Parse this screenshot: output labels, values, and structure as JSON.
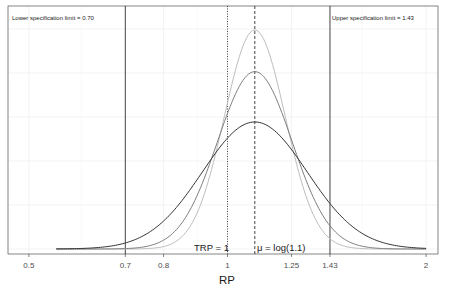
{
  "chart_data": {
    "type": "line",
    "title": "",
    "xlabel": "RP",
    "ylabel": "",
    "x_scale": "log",
    "xlim": [
      0.5,
      2
    ],
    "x_ticks": [
      0.5,
      0.7,
      0.8,
      1,
      1.25,
      1.43,
      2
    ],
    "x_tick_labels": [
      "0.5",
      "0.7",
      "0.8",
      "1",
      "1.25",
      "1.43",
      "2"
    ],
    "grid": true,
    "legend": null,
    "mu_log": 0.0953,
    "series": [
      {
        "name": "density-wide",
        "color": "#333333",
        "sd_log": 0.183,
        "relative_peak": 0.58
      },
      {
        "name": "density-medium",
        "color": "#7f7f7f",
        "sd_log": 0.13,
        "relative_peak": 0.81
      },
      {
        "name": "density-narrow",
        "color": "#bdbdbd",
        "sd_log": 0.106,
        "relative_peak": 1.0
      }
    ],
    "vertical_lines": [
      {
        "x": 0.7,
        "style": "solid",
        "label": "Lower specification limit =  0.70"
      },
      {
        "x": 1.43,
        "style": "solid",
        "label": "Upper specification limit = 1.43"
      },
      {
        "x": 1.0,
        "style": "dotted",
        "label": "TRP = 1"
      },
      {
        "x": 1.1,
        "style": "dashed",
        "label": "μ = log(1.1)"
      }
    ]
  },
  "annotations": {
    "lower": "Lower specification limit =  0.70",
    "upper": "Upper specification limit = 1.43",
    "trp": "TRP = 1",
    "mu": "μ = log(1.1)"
  }
}
